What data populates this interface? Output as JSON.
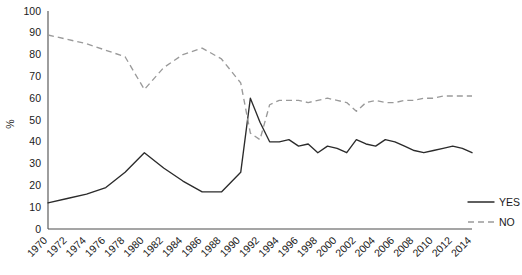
{
  "chart_data": {
    "type": "line",
    "title": "",
    "xlabel": "",
    "ylabel": "%",
    "ylim": [
      0,
      100
    ],
    "xlim": [
      1970,
      2014
    ],
    "grid": false,
    "legend_position": "right",
    "ytick_labels": [
      "0",
      "10",
      "20",
      "30",
      "40",
      "50",
      "60",
      "70",
      "80",
      "90",
      "100"
    ],
    "ytick_values": [
      0,
      10,
      20,
      30,
      40,
      50,
      60,
      70,
      80,
      90,
      100
    ],
    "xtick_labels": [
      "1970",
      "1972",
      "1974",
      "1976",
      "1978",
      "1980",
      "1982",
      "1984",
      "1986",
      "1988",
      "1990",
      "1992",
      "1994",
      "1996",
      "1998",
      "2000",
      "2002",
      "2004",
      "2006",
      "2008",
      "2010",
      "2012",
      "2014"
    ],
    "x": [
      1970,
      1972,
      1974,
      1976,
      1978,
      1980,
      1982,
      1984,
      1986,
      1988,
      1990,
      1991,
      1992,
      1993,
      1994,
      1995,
      1996,
      1997,
      1998,
      1999,
      2000,
      2001,
      2002,
      2003,
      2004,
      2005,
      2006,
      2007,
      2008,
      2009,
      2010,
      2011,
      2012,
      2013,
      2014
    ],
    "series": [
      {
        "name": "YES",
        "style": "solid",
        "color": "#2b2b2b",
        "values": [
          12,
          14,
          16,
          19,
          26,
          35,
          28,
          22,
          17,
          17,
          26,
          60,
          49,
          40,
          40,
          41,
          38,
          39,
          35,
          38,
          37,
          35,
          41,
          39,
          38,
          41,
          40,
          38,
          36,
          35,
          36,
          37,
          38,
          37,
          35
        ]
      },
      {
        "name": "NO",
        "style": "dashed",
        "color": "#9a9a9a",
        "values": [
          89,
          87,
          85,
          82,
          79,
          64,
          74,
          80,
          83,
          78,
          67,
          44,
          41,
          57,
          59,
          59,
          59,
          58,
          59,
          60,
          59,
          58,
          54,
          58,
          59,
          58,
          58,
          59,
          59,
          60,
          60,
          61,
          61,
          61,
          61
        ]
      }
    ],
    "legend": [
      {
        "label": "YES",
        "style": "solid",
        "color": "#2b2b2b"
      },
      {
        "label": "NO",
        "style": "dashed",
        "color": "#9a9a9a"
      }
    ]
  }
}
